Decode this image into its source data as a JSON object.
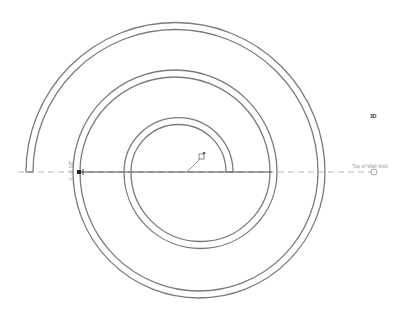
{
  "view": {
    "tag": "3D",
    "reference_plane_label": "Top of Wall Void",
    "dimension_label": "0 - 0 1/2\""
  },
  "colors": {
    "wall_stroke": "#7a7a7a",
    "reference_line": "#b8b8b8",
    "dimension_line": "#3a3a3a",
    "background": "#ffffff"
  },
  "icons": {
    "reference_end": "circle-grip",
    "origin_marker": "square-grip"
  }
}
